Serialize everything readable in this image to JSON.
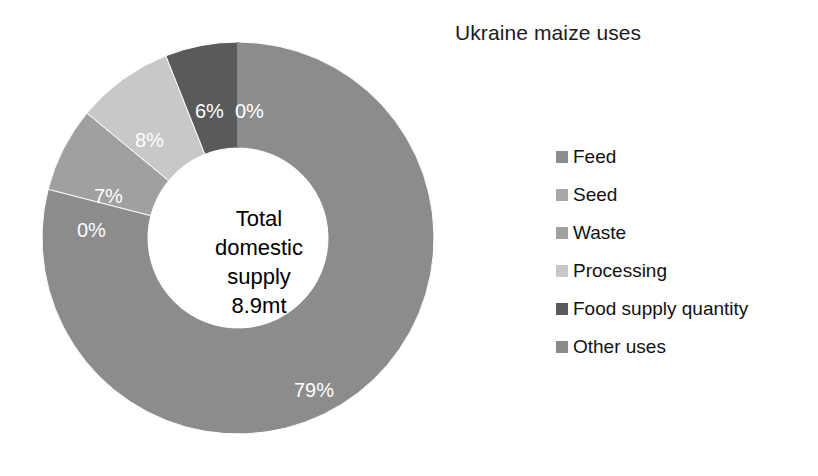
{
  "chart_data": {
    "type": "pie",
    "variant": "doughnut",
    "title": "Ukraine maize uses",
    "center_label": [
      "Total",
      "domestic",
      "supply",
      "8.9mt"
    ],
    "center_label_text": "Total domestic supply 8.9mt",
    "total_value": "8.9mt",
    "categories": [
      "Feed",
      "Seed",
      "Waste",
      "Processing",
      "Food supply quantity",
      "Other uses"
    ],
    "values": [
      79,
      0,
      7,
      8,
      6,
      0
    ],
    "data_labels": [
      "79%",
      "0%",
      "7%",
      "8%",
      "6%",
      "0%"
    ],
    "colors": [
      "#8c8c8c",
      "#a8a8a8",
      "#a0a0a0",
      "#c8c8c8",
      "#5a5a5a",
      "#8a8a8a"
    ],
    "unit": "%",
    "legend_position": "right",
    "grid": false,
    "xlabel": "",
    "ylabel": "",
    "start_angle_deg": 0,
    "direction": "clockwise"
  },
  "legend": {
    "items": [
      {
        "label": "Feed",
        "color": "#8c8c8c"
      },
      {
        "label": "Seed",
        "color": "#a8a8a8"
      },
      {
        "label": "Waste",
        "color": "#a0a0a0"
      },
      {
        "label": "Processing",
        "color": "#c8c8c8"
      },
      {
        "label": "Food supply quantity",
        "color": "#5a5a5a"
      },
      {
        "label": "Other uses",
        "color": "#8a8a8a"
      }
    ]
  },
  "slice_labels": [
    {
      "text": "79%",
      "left": 272,
      "top": 357
    },
    {
      "text": "0%",
      "left": 55,
      "top": 197
    },
    {
      "text": "7%",
      "left": 72,
      "top": 163
    },
    {
      "text": "8%",
      "left": 113,
      "top": 107
    },
    {
      "text": "6%",
      "left": 173,
      "top": 78
    },
    {
      "text": "0%",
      "left": 213,
      "top": 78
    }
  ]
}
